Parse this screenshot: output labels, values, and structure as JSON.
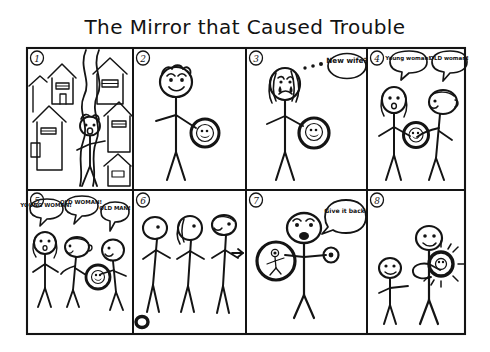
{
  "comic": {
    "title": "The Mirror that Caused Trouble",
    "medium": "hand-drawn black ink stick-figure comic on white paper",
    "grid": {
      "rows": 2,
      "columns": 4,
      "panel_count": 8
    },
    "panels": [
      {
        "number": "1",
        "number_style": "circled",
        "scene": "street-with-houses",
        "description": "A stick figure with an open mouth walks along a winding road between several houses with pitched roofs and windows.",
        "characters": [
          "walking-figure"
        ],
        "props": [
          "houses",
          "winding-road"
        ],
        "speech": []
      },
      {
        "number": "2",
        "number_style": "circled",
        "scene": "figure-finds-mirror",
        "description": "A smiling stick figure with curly hair holds a round hand mirror that shows a tiny reflected face.",
        "characters": [
          "man"
        ],
        "props": [
          "round-mirror"
        ],
        "speech": []
      },
      {
        "number": "3",
        "number_style": "circled",
        "scene": "wife-sees-mirror",
        "description": "A crying figure with long hair and tears looks at the mirror and thinks.",
        "characters": [
          "wife"
        ],
        "props": [
          "round-mirror",
          "thought-dots"
        ],
        "speech": [
          {
            "speaker": "wife",
            "bubble": "thought",
            "text": "New wife?"
          }
        ]
      },
      {
        "number": "4",
        "number_style": "circled",
        "scene": "two-women-argue",
        "description": "A young woman and an older woman argue over the mirror, each shouting a different answer.",
        "characters": [
          "young-woman",
          "old-woman"
        ],
        "props": [
          "round-mirror"
        ],
        "speech": [
          {
            "speaker": "young-woman",
            "bubble": "speech",
            "text": "Young woman!"
          },
          {
            "speaker": "old-woman",
            "bubble": "speech",
            "text": "OLD woman!"
          }
        ]
      },
      {
        "number": "5",
        "number_style": "circled",
        "scene": "three-way-argument",
        "description": "Three figures argue at once about who is in the mirror while one holds it.",
        "characters": [
          "young-woman",
          "old-woman",
          "old-man"
        ],
        "props": [
          "round-mirror"
        ],
        "speech": [
          {
            "speaker": "young-woman",
            "bubble": "speech",
            "text": "YOUNG WOMAN!"
          },
          {
            "speaker": "old-woman",
            "bubble": "speech",
            "text": "OLD WOMAN!"
          },
          {
            "speaker": "old-man",
            "bubble": "speech",
            "text": "OLD MAN!"
          }
        ]
      },
      {
        "number": "6",
        "number_style": "circled",
        "scene": "mirror-dropped",
        "description": "Three figures stand in a row turning to look to the right; the mirror lies dropped on the ground, an arrow points right.",
        "characters": [
          "figure-one",
          "figure-two",
          "figure-three"
        ],
        "props": [
          "dropped-mirror",
          "arrow-right"
        ],
        "speech": []
      },
      {
        "number": "7",
        "number_style": "circled",
        "scene": "give-it-back",
        "description": "A shouting figure holds the big mirror in one hand and a small object in the other.",
        "characters": [
          "shouting-figure"
        ],
        "props": [
          "round-mirror",
          "small-object"
        ],
        "speech": [
          {
            "speaker": "shouting-figure",
            "bubble": "speech",
            "text": "Give it back!"
          }
        ]
      },
      {
        "number": "8",
        "number_style": "circled",
        "scene": "mirror-shines",
        "description": "A tall smiling figure holds up the mirror which now radiates shine lines while a smaller figure stands beside.",
        "characters": [
          "tall-figure",
          "small-figure"
        ],
        "props": [
          "shining-mirror",
          "shine-rays"
        ],
        "speech": []
      }
    ],
    "colors": {
      "ink": "#141414",
      "paper": "#ffffff"
    }
  }
}
